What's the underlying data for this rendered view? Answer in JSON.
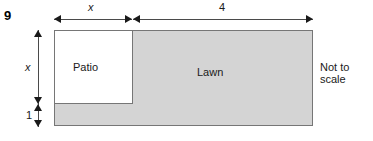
{
  "question": {
    "number": "9",
    "note_line1": "Not to",
    "note_line2": "scale"
  },
  "figure": {
    "outer_region_label": "Lawn",
    "inner_region_label": "Patio",
    "outer_fill_color": "#d4d4d4",
    "inner_fill_color": "#ffffff",
    "stroke_color": "#767676",
    "dimensions": {
      "top_left": "x",
      "top_right": "4",
      "left_upper": "x",
      "left_lower": "1"
    }
  }
}
